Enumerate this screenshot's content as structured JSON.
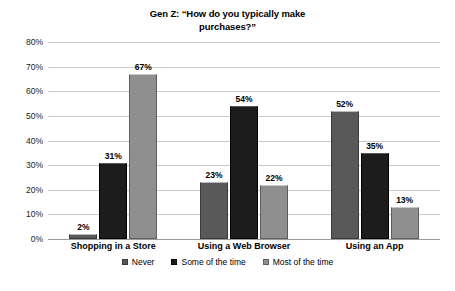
{
  "chart_data": {
    "type": "bar",
    "title": "Gen Z: “How do you typically make\npurchases?”",
    "xlabel": "",
    "ylabel": "",
    "ylim": [
      0,
      80
    ],
    "ytick_labels": [
      "80%",
      "70%",
      "60%",
      "50%",
      "40%",
      "30%",
      "20%",
      "10%",
      "0%"
    ],
    "ytick_values": [
      80,
      70,
      60,
      50,
      40,
      30,
      20,
      10,
      0
    ],
    "grid": true,
    "legend_position": "bottom",
    "categories": [
      "Shopping in a Store",
      "Using a Web Browser",
      "Using an App"
    ],
    "series": [
      {
        "name": "Never",
        "color": "#595959",
        "values": [
          2,
          23,
          52
        ],
        "labels": [
          "2%",
          "23%",
          "52%"
        ]
      },
      {
        "name": "Some of the time",
        "color": "#1c1c1c",
        "values": [
          31,
          54,
          35
        ],
        "labels": [
          "31%",
          "54%",
          "35%"
        ]
      },
      {
        "name": "Most of the time",
        "color": "#8f8f8f",
        "values": [
          67,
          22,
          13
        ],
        "labels": [
          "67%",
          "22%",
          "13%"
        ]
      }
    ]
  }
}
